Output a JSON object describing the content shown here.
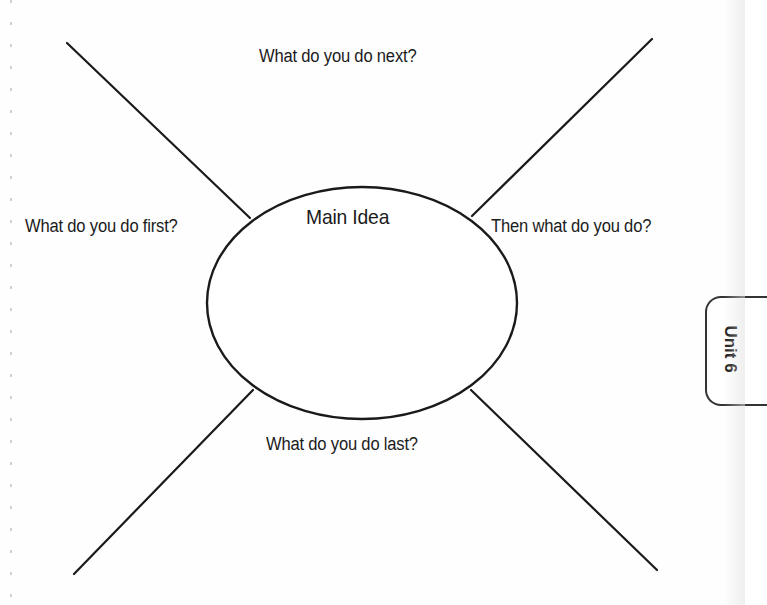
{
  "diagram": {
    "type": "sequence-web graphic organizer",
    "center": {
      "label": "Main Idea"
    },
    "prompts": {
      "top": "What do you do next?",
      "left": "What do you do first?",
      "right": "Then what do you do?",
      "bottom": "What do you do last?"
    },
    "colors": {
      "ink": "#1a1a1a",
      "paper": "#ffffff"
    }
  },
  "tab": {
    "label": "Unit 6"
  }
}
